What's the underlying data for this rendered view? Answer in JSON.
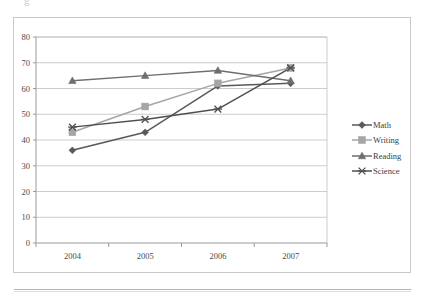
{
  "page": {
    "artifact_text": "g",
    "rule_visible": true
  },
  "chart_data": {
    "type": "line",
    "title": "",
    "subtitle": "",
    "xlabel": "",
    "ylabel": "",
    "categories": [
      "2004",
      "2005",
      "2006",
      "2007"
    ],
    "x_tick_labels": [
      "2004",
      "2005",
      "2006",
      "2007"
    ],
    "y_tick_labels": [
      "0",
      "10",
      "20",
      "30",
      "40",
      "50",
      "60",
      "70",
      "80"
    ],
    "ylim": [
      0,
      80
    ],
    "y_tick_step": 10,
    "grid": "horizontal",
    "legend_position": "right",
    "series": [
      {
        "name": "Math",
        "marker": "diamond",
        "color": "#595959",
        "values": [
          36,
          43,
          61,
          62
        ]
      },
      {
        "name": "Writing",
        "marker": "square",
        "color": "#a6a6a6",
        "values": [
          43,
          53,
          62,
          68
        ]
      },
      {
        "name": "Reading",
        "marker": "triangle",
        "color": "#6e6e6e",
        "values": [
          63,
          65,
          67,
          63
        ]
      },
      {
        "name": "Science",
        "marker": "x",
        "color": "#4f4f4f",
        "values": [
          45,
          48,
          52,
          68
        ]
      }
    ]
  },
  "colors": {
    "frame_border": "#c8c8c8",
    "gridline": "#bfbfbf",
    "axis": "#9a9a9a",
    "text": "#3c3c3c",
    "background": "#ffffff"
  }
}
